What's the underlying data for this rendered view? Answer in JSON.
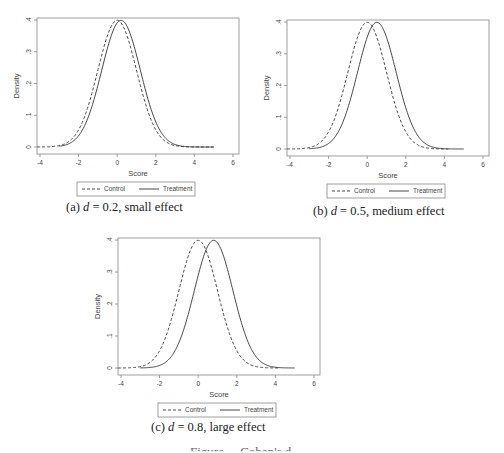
{
  "figure": {
    "caption_partial": "Figure ... Cohen's d ..."
  },
  "style": {
    "line_color": "#333333",
    "frame_color": "#888888",
    "text_color": "#444444"
  },
  "chart_data": [
    {
      "id": "a",
      "type": "line",
      "title": "",
      "caption_prefix": "(a) ",
      "caption_var": "d",
      "caption_rest": " = 0.2, small effect",
      "xlabel": "Score",
      "ylabel": "Density",
      "xlim": [
        -4.15,
        6.15
      ],
      "ylim": [
        -0.0,
        0.41
      ],
      "xticks": [
        -4,
        -2,
        0,
        2,
        4,
        6
      ],
      "xtick_labels": [
        "-4",
        "-2",
        "0",
        "2",
        "4",
        "6"
      ],
      "yticks": [
        0,
        0.1,
        0.2,
        0.3,
        0.4
      ],
      "ytick_labels": [
        "0",
        ".1",
        ".2",
        ".3",
        ".4"
      ],
      "grid": false,
      "legend_position": "bottom",
      "series": [
        {
          "name": "Control",
          "style": "dashed",
          "distribution": "normal",
          "mean": 0.0,
          "sd": 1,
          "x_range": [
            -4.15,
            5
          ]
        },
        {
          "name": "Treatment",
          "style": "solid",
          "distribution": "normal",
          "mean": 0.2,
          "sd": 1,
          "x_range": [
            -3.0,
            5
          ]
        }
      ],
      "peak_density": 0.399
    },
    {
      "id": "b",
      "type": "line",
      "title": "",
      "caption_prefix": "(b) ",
      "caption_var": "d",
      "caption_rest": " = 0.5, medium effect",
      "xlabel": "Score",
      "ylabel": "Density",
      "xlim": [
        -4.15,
        6.15
      ],
      "ylim": [
        -0.0,
        0.41
      ],
      "xticks": [
        -4,
        -2,
        0,
        2,
        4,
        6
      ],
      "xtick_labels": [
        "-4",
        "-2",
        "0",
        "2",
        "4",
        "6"
      ],
      "yticks": [
        0,
        0.1,
        0.2,
        0.3,
        0.4
      ],
      "ytick_labels": [
        "0",
        ".1",
        ".2",
        ".3",
        ".4"
      ],
      "grid": false,
      "legend_position": "bottom",
      "series": [
        {
          "name": "Control",
          "style": "dashed",
          "distribution": "normal",
          "mean": 0.0,
          "sd": 1,
          "x_range": [
            -4.15,
            4.2
          ]
        },
        {
          "name": "Treatment",
          "style": "solid",
          "distribution": "normal",
          "mean": 0.5,
          "sd": 1,
          "x_range": [
            -3.0,
            5
          ]
        }
      ],
      "peak_density": 0.399
    },
    {
      "id": "c",
      "type": "line",
      "title": "",
      "caption_prefix": "(c) ",
      "caption_var": "d",
      "caption_rest": " = 0.8, large effect",
      "xlabel": "Score",
      "ylabel": "Density",
      "xlim": [
        -4.15,
        6.15
      ],
      "ylim": [
        -0.0,
        0.41
      ],
      "xticks": [
        -4,
        -2,
        0,
        2,
        4,
        6
      ],
      "xtick_labels": [
        "-4",
        "-2",
        "0",
        "2",
        "4",
        "6"
      ],
      "yticks": [
        0,
        0.1,
        0.2,
        0.3,
        0.4
      ],
      "ytick_labels": [
        "0",
        ".1",
        ".2",
        ".3",
        ".4"
      ],
      "grid": false,
      "legend_position": "bottom",
      "series": [
        {
          "name": "Control",
          "style": "dashed",
          "distribution": "normal",
          "mean": 0.0,
          "sd": 1,
          "x_range": [
            -4.15,
            4.2
          ]
        },
        {
          "name": "Treatment",
          "style": "solid",
          "distribution": "normal",
          "mean": 0.8,
          "sd": 1,
          "x_range": [
            -3.0,
            5
          ]
        }
      ],
      "peak_density": 0.399
    }
  ],
  "legend": {
    "control_label": "Control",
    "treatment_label": "Treatment"
  }
}
